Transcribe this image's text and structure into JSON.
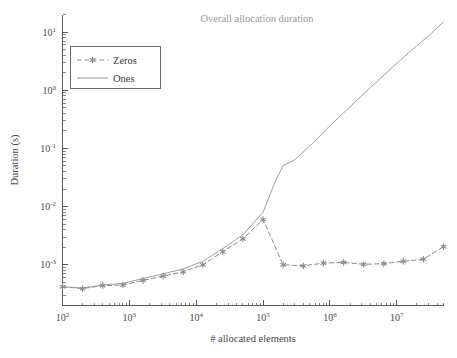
{
  "chart_data": {
    "type": "line",
    "title": "Overall allocation duration",
    "xlabel": "# allocated elements",
    "ylabel": "Duration (s)",
    "xscale": "log",
    "yscale": "log",
    "xlim": [
      100,
      50000000
    ],
    "ylim": [
      0.0002,
      20
    ],
    "grid": false,
    "legend_position": "upper left",
    "xticks": [
      {
        "value": 100,
        "label": "10",
        "exponent": "2"
      },
      {
        "value": 1000,
        "label": "10",
        "exponent": "3"
      },
      {
        "value": 10000,
        "label": "10",
        "exponent": "4"
      },
      {
        "value": 100000,
        "label": "10",
        "exponent": "5"
      },
      {
        "value": 1000000,
        "label": "10",
        "exponent": "6"
      },
      {
        "value": 10000000,
        "label": "10",
        "exponent": "7"
      }
    ],
    "yticks": [
      {
        "value": 10,
        "label": "10",
        "exponent": "1"
      },
      {
        "value": 1,
        "label": "10",
        "exponent": "0"
      },
      {
        "value": 0.1,
        "label": "10",
        "exponent": "-1"
      },
      {
        "value": 0.01,
        "label": "10",
        "exponent": "-2"
      },
      {
        "value": 0.001,
        "label": "10",
        "exponent": "-3"
      }
    ],
    "series": [
      {
        "name": "Zeros",
        "color": "#8a8a93",
        "marker": "star",
        "linestyle": "dashed",
        "points": [
          [
            100,
            0.00042
          ],
          [
            200,
            0.00039
          ],
          [
            400,
            0.00044
          ],
          [
            800,
            0.00045
          ],
          [
            1600,
            0.00054
          ],
          [
            3200,
            0.00064
          ],
          [
            6400,
            0.00076
          ],
          [
            12500,
            0.001
          ],
          [
            25000,
            0.00168
          ],
          [
            50000,
            0.0028
          ],
          [
            100000,
            0.006
          ],
          [
            200000,
            0.001
          ],
          [
            400000,
            0.00096
          ],
          [
            800000,
            0.00107
          ],
          [
            1600000,
            0.0011
          ],
          [
            3200000,
            0.00102
          ],
          [
            6400000,
            0.00105
          ],
          [
            12500000,
            0.00115
          ],
          [
            25000000,
            0.00125
          ],
          [
            50000000,
            0.00205
          ]
        ]
      },
      {
        "name": "Ones",
        "color": "#93939a",
        "marker": "none",
        "linestyle": "solid",
        "points": [
          [
            100,
            0.00042
          ],
          [
            200,
            0.0004
          ],
          [
            400,
            0.00045
          ],
          [
            800,
            0.00048
          ],
          [
            1600,
            0.00058
          ],
          [
            3200,
            0.0007
          ],
          [
            6400,
            0.00085
          ],
          [
            12500,
            0.00115
          ],
          [
            25000,
            0.0019
          ],
          [
            50000,
            0.0033
          ],
          [
            100000,
            0.008
          ],
          [
            150000,
            0.026
          ],
          [
            200000,
            0.051
          ],
          [
            300000,
            0.064
          ],
          [
            500000,
            0.11
          ],
          [
            1000000,
            0.245
          ],
          [
            2000000,
            0.52
          ],
          [
            4000000,
            1.1
          ],
          [
            8000000,
            2.3
          ],
          [
            16000000,
            4.7
          ],
          [
            30000000,
            8.6
          ],
          [
            50000000,
            15.0
          ]
        ]
      }
    ]
  },
  "legend": {
    "items": [
      {
        "label": "Zeros"
      },
      {
        "label": "Ones"
      }
    ]
  }
}
